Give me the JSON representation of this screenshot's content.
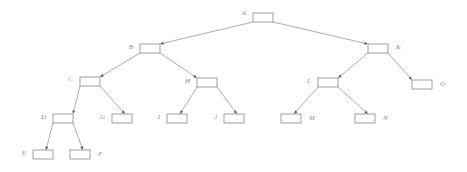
{
  "diagram": {
    "type": "tree",
    "title": "",
    "background_color": "#ffffff",
    "node_stroke_color": "#777777",
    "node_fill_color": "#ffffff",
    "edge_color": "#8a8a8a",
    "label_color": "#8d8d8d",
    "arrow_color": "#555555",
    "node_count": 15,
    "edge_count": 14,
    "root": "A",
    "nodes": [
      {
        "id": "A",
        "label": "A",
        "x": 253,
        "y": 13,
        "w": 20,
        "h": 9,
        "label_x": 246,
        "label_y": 13,
        "label_side": "left"
      },
      {
        "id": "B",
        "label": "B",
        "x": 140,
        "y": 44,
        "w": 20,
        "h": 9,
        "label_x": 133,
        "label_y": 47,
        "label_side": "left"
      },
      {
        "id": "K",
        "label": "K",
        "x": 368,
        "y": 44,
        "w": 20,
        "h": 9,
        "label_x": 396,
        "label_y": 47,
        "label_side": "right"
      },
      {
        "id": "C",
        "label": "C",
        "x": 80,
        "y": 77,
        "w": 20,
        "h": 9,
        "label_x": 73,
        "label_y": 79,
        "label_side": "left"
      },
      {
        "id": "H",
        "label": "H",
        "x": 197,
        "y": 78,
        "w": 20,
        "h": 9,
        "label_x": 190,
        "label_y": 81,
        "label_side": "left"
      },
      {
        "id": "L",
        "label": "L",
        "x": 318,
        "y": 78,
        "w": 20,
        "h": 9,
        "label_x": 311,
        "label_y": 81,
        "label_side": "left"
      },
      {
        "id": "O",
        "label": "O",
        "x": 412,
        "y": 80,
        "w": 20,
        "h": 9,
        "label_x": 440,
        "label_y": 84,
        "label_side": "right"
      },
      {
        "id": "D",
        "label": "D",
        "x": 53,
        "y": 114,
        "w": 20,
        "h": 9,
        "label_x": 46,
        "label_y": 117,
        "label_side": "left"
      },
      {
        "id": "G",
        "label": "G",
        "x": 112,
        "y": 114,
        "w": 20,
        "h": 9,
        "label_x": 105,
        "label_y": 117,
        "label_side": "left"
      },
      {
        "id": "I",
        "label": "I",
        "x": 167,
        "y": 114,
        "w": 20,
        "h": 9,
        "label_x": 160,
        "label_y": 117,
        "label_side": "left"
      },
      {
        "id": "J",
        "label": "J",
        "x": 224,
        "y": 114,
        "w": 20,
        "h": 9,
        "label_x": 217,
        "label_y": 117,
        "label_side": "left"
      },
      {
        "id": "M",
        "label": "M",
        "x": 281,
        "y": 114,
        "w": 20,
        "h": 9,
        "label_x": 309,
        "label_y": 118,
        "label_side": "right"
      },
      {
        "id": "N",
        "label": "N",
        "x": 355,
        "y": 114,
        "w": 20,
        "h": 9,
        "label_x": 383,
        "label_y": 118,
        "label_side": "right"
      },
      {
        "id": "E",
        "label": "E",
        "x": 33,
        "y": 150,
        "w": 20,
        "h": 9,
        "label_x": 26,
        "label_y": 153,
        "label_side": "left"
      },
      {
        "id": "F",
        "label": "F",
        "x": 70,
        "y": 150,
        "w": 20,
        "h": 9,
        "label_x": 98,
        "label_y": 154,
        "label_side": "right"
      }
    ],
    "edges": [
      {
        "from": "A",
        "to": "B",
        "x1": 253,
        "y1": 22,
        "x2": 160,
        "y2": 44
      },
      {
        "from": "A",
        "to": "K",
        "x1": 273,
        "y1": 22,
        "x2": 368,
        "y2": 44
      },
      {
        "from": "B",
        "to": "C",
        "x1": 140,
        "y1": 53,
        "x2": 100,
        "y2": 77
      },
      {
        "from": "B",
        "to": "H",
        "x1": 160,
        "y1": 53,
        "x2": 197,
        "y2": 78
      },
      {
        "from": "K",
        "to": "L",
        "x1": 368,
        "y1": 53,
        "x2": 338,
        "y2": 78
      },
      {
        "from": "K",
        "to": "O",
        "x1": 388,
        "y1": 53,
        "x2": 412,
        "y2": 80
      },
      {
        "from": "C",
        "to": "D",
        "x1": 80,
        "y1": 86,
        "x2": 73,
        "y2": 114
      },
      {
        "from": "C",
        "to": "G",
        "x1": 100,
        "y1": 86,
        "x2": 125,
        "y2": 114
      },
      {
        "from": "H",
        "to": "I",
        "x1": 197,
        "y1": 87,
        "x2": 180,
        "y2": 114
      },
      {
        "from": "H",
        "to": "J",
        "x1": 217,
        "y1": 87,
        "x2": 237,
        "y2": 114
      },
      {
        "from": "L",
        "to": "M",
        "x1": 318,
        "y1": 87,
        "x2": 294,
        "y2": 114
      },
      {
        "from": "L",
        "to": "N",
        "x1": 338,
        "y1": 87,
        "x2": 368,
        "y2": 114
      },
      {
        "from": "D",
        "to": "E",
        "x1": 53,
        "y1": 123,
        "x2": 46,
        "y2": 150
      },
      {
        "from": "D",
        "to": "F",
        "x1": 73,
        "y1": 123,
        "x2": 83,
        "y2": 150
      }
    ]
  }
}
